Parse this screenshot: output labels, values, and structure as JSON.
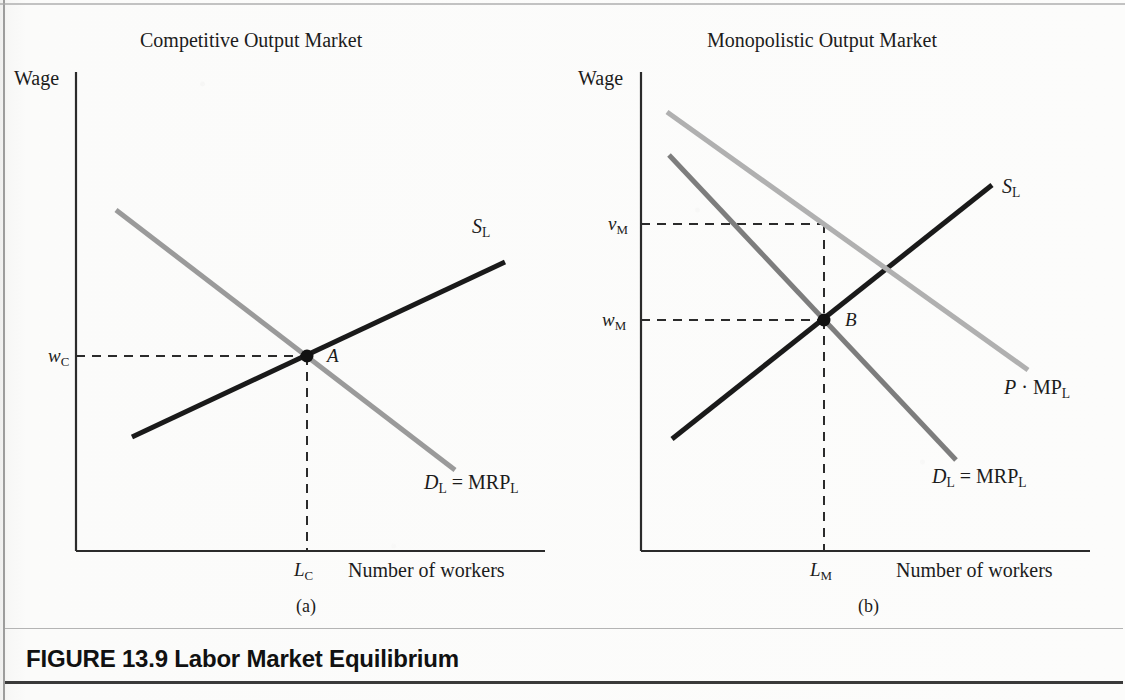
{
  "figure": {
    "number_label": "FIGURE 13.9",
    "title": "Labor Market Equilibrium"
  },
  "panels": [
    {
      "id": "a",
      "title": "Competitive Output Market",
      "subcaption": "(a)",
      "y_axis_label": "Wage",
      "x_axis_label": "Number of workers",
      "y_tick_label": "w",
      "y_tick_sub": "C",
      "x_tick_label": "L",
      "x_tick_sub": "C",
      "equilibrium_point_label": "A",
      "curves": [
        {
          "name": "supply",
          "label_main": "S",
          "label_sub": "L",
          "color": "#1a1a1a"
        },
        {
          "name": "demand",
          "label_main": "D",
          "label_sub": "L",
          "label_rest": " = MRP",
          "label_rest_sub": "L",
          "color": "#9a9a9a"
        }
      ]
    },
    {
      "id": "b",
      "title": "Monopolistic Output Market",
      "subcaption": "(b)",
      "y_axis_label": "Wage",
      "x_axis_label": "Number of workers",
      "y_tick_label_upper": "v",
      "y_tick_upper_sub": "M",
      "y_tick_label_lower": "w",
      "y_tick_lower_sub": "M",
      "x_tick_label": "L",
      "x_tick_sub": "M",
      "equilibrium_point_label": "B",
      "curves": [
        {
          "name": "supply",
          "label_main": "S",
          "label_sub": "L",
          "color": "#1a1a1a"
        },
        {
          "name": "value-marginal-product",
          "label_main": "P",
          "label_mid": " · MP",
          "label_sub": "L",
          "color": "#b0b0b0"
        },
        {
          "name": "demand",
          "label_main": "D",
          "label_sub": "L",
          "label_rest": " = MRP",
          "label_rest_sub": "L",
          "color": "#7d7d7d"
        }
      ]
    }
  ],
  "chart_data": {
    "type": "line",
    "title": "Labor Market Equilibrium",
    "panels": [
      {
        "id": "a",
        "title": "Competitive Output Market",
        "xlabel": "Number of workers",
        "ylabel": "Wage",
        "axes": {
          "y_axis_x": 76,
          "y_axis_top": 72,
          "x_axis_y": 551,
          "x_axis_right": 545
        },
        "series": [
          {
            "name": "S_L",
            "role": "labor supply",
            "color": "#1a1a1a",
            "width": 5,
            "points": [
              [
                132,
                437
              ],
              [
                505,
                262
              ]
            ],
            "label_pos": [
              478,
              232
            ]
          },
          {
            "name": "D_L = MRP_L",
            "role": "labor demand / marginal revenue product",
            "color": "#9a9a9a",
            "width": 5,
            "points": [
              [
                116,
                210
              ],
              [
                455,
                470
              ]
            ],
            "label_pos": [
              424,
              487
            ]
          }
        ],
        "equilibrium": {
          "label": "A",
          "x": 307,
          "y": 356,
          "label_pos": [
            327,
            363
          ]
        },
        "guides": [
          {
            "type": "horizontal-dashed",
            "from": [
              76,
              356
            ],
            "to": [
              307,
              356
            ],
            "tick": "w_C"
          },
          {
            "type": "vertical-dashed",
            "from": [
              307,
              356
            ],
            "to": [
              307,
              551
            ],
            "tick": "L_C"
          }
        ],
        "tick_positions": {
          "w_C": [
            48,
            365
          ],
          "L_C": [
            296,
            578
          ]
        }
      },
      {
        "id": "b",
        "title": "Monopolistic Output Market",
        "xlabel": "Number of workers",
        "ylabel": "Wage",
        "axes": {
          "y_axis_x": 641,
          "y_axis_top": 72,
          "x_axis_y": 551,
          "x_axis_right": 1090
        },
        "series": [
          {
            "name": "S_L",
            "role": "labor supply",
            "color": "#1a1a1a",
            "width": 5,
            "points": [
              [
                672,
                439
              ],
              [
                992,
                185
              ]
            ],
            "label_pos": [
              1004,
              190
            ]
          },
          {
            "name": "P · MP_L",
            "role": "value of marginal product",
            "color": "#b0b0b0",
            "width": 5,
            "points": [
              [
                667,
                112
              ],
              [
                1028,
                370
              ]
            ],
            "label_pos": [
              1008,
              382
            ]
          },
          {
            "name": "D_L = MRP_L",
            "role": "labor demand / marginal revenue product",
            "color": "#7d7d7d",
            "width": 5,
            "points": [
              [
                669,
                155
              ],
              [
                956,
                460
              ]
            ],
            "label_pos": [
              936,
              477
            ]
          }
        ],
        "equilibrium": {
          "label": "B",
          "x": 824,
          "y": 320,
          "label_pos": [
            845,
            327
          ]
        },
        "guides": [
          {
            "type": "horizontal-dashed",
            "from": [
              641,
              320
            ],
            "to": [
              824,
              320
            ],
            "tick": "w_M"
          },
          {
            "type": "horizontal-dashed",
            "from": [
              641,
              224
            ],
            "to": [
              824,
              224
            ],
            "tick": "v_M"
          },
          {
            "type": "vertical-dashed",
            "from": [
              824,
              224
            ],
            "to": [
              824,
              551
            ],
            "tick": "L_M"
          }
        ],
        "tick_positions": {
          "v_M": [
            608,
            233
          ],
          "w_M": [
            604,
            329
          ],
          "L_M": [
            812,
            578
          ]
        }
      }
    ]
  }
}
